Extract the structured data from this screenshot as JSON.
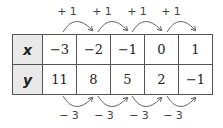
{
  "table": {
    "rows": [
      {
        "label": "x",
        "values": [
          "−3",
          "−2",
          "−1",
          "0",
          "1"
        ]
      },
      {
        "label": "y",
        "values": [
          "11",
          "8",
          "5",
          "2",
          "−1"
        ]
      }
    ]
  },
  "top_arrows": {
    "labels": [
      "+ 1",
      "+ 1",
      "+ 1",
      "+ 1"
    ]
  },
  "bottom_arrows": {
    "labels": [
      "− 3",
      "− 3",
      "− 3",
      "− 3"
    ]
  },
  "colors": {
    "header_bg": "#e9e9e9",
    "border": "#555555",
    "arrow": "#555555"
  }
}
